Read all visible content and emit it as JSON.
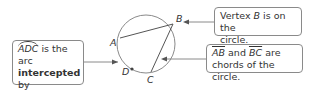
{
  "diagram": {
    "points": {
      "A": "A",
      "B": "B",
      "C": "C",
      "D": "D"
    },
    "callouts": {
      "left": {
        "arc_name": "ADC",
        "text1": " is the arc",
        "bold": "intercepted",
        "text2": " by",
        "angle": "∠ABC."
      },
      "top_right": {
        "text1": "Vertex ",
        "point": "B",
        "text2": " is on the",
        "line2": "circle."
      },
      "bottom_right": {
        "seg1": "AB",
        "mid": " and ",
        "seg2": "BC",
        "end": " are",
        "line2": "chords of the circle."
      }
    },
    "colors": {
      "line": "#8a8a8a",
      "text": "#333333"
    }
  }
}
